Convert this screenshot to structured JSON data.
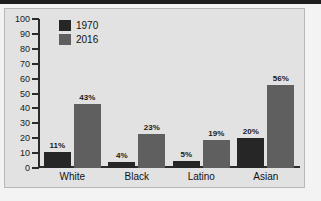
{
  "chart_data": {
    "type": "bar",
    "title": "",
    "subtitle": "",
    "xlabel": "",
    "ylabel": "",
    "categories": [
      "White",
      "Black",
      "Latino",
      "Asian"
    ],
    "series": [
      {
        "name": "1970",
        "color": "#262626",
        "values": [
          11,
          4,
          5,
          20
        ],
        "labels": [
          "11%",
          "4%",
          "5%",
          "20%"
        ]
      },
      {
        "name": "2016",
        "color": "#5f5f5f",
        "values": [
          43,
          23,
          19,
          56
        ],
        "labels": [
          "43%",
          "23%",
          "19%",
          "56%"
        ]
      }
    ],
    "ylim": [
      0,
      100
    ],
    "ytick_step": 10,
    "yticks": [
      100,
      90,
      80,
      70,
      60,
      50,
      40,
      30,
      20,
      10,
      0
    ],
    "ytick_labels": [
      "100",
      "90",
      "80",
      "70",
      "60",
      "50",
      "40",
      "30",
      "20",
      "10",
      "0"
    ],
    "grid": false,
    "legend_position": "top-left",
    "value_labels_shown": true
  },
  "legend": {
    "entries": [
      {
        "label": "1970",
        "color": "#262626"
      },
      {
        "label": "2016",
        "color": "#5f5f5f"
      }
    ]
  },
  "colors": {
    "page_background": "#ffffff",
    "figure_background": "#f3f3f3",
    "panel_background": "#e2e2e2",
    "panel_border": "#b8b8b8",
    "axis": "#2b2b2b",
    "top_rule": "#1d1d1d",
    "text": "#111111",
    "series_1970": "#262626",
    "series_2016": "#5f5f5f"
  }
}
